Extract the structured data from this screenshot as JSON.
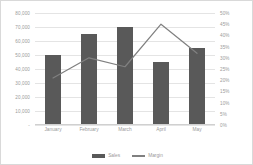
{
  "chart_data": {
    "type": "bar",
    "title": "",
    "xlabel": "",
    "ylabel": "",
    "categories": [
      "January",
      "February",
      "March",
      "April",
      "May"
    ],
    "series": [
      {
        "name": "Sales",
        "type": "bar",
        "axis": "left",
        "color": "#595959",
        "values": [
          50000,
          65000,
          70000,
          45000,
          55000
        ]
      },
      {
        "name": "Margin",
        "type": "line",
        "axis": "right",
        "color": "#808080",
        "values": [
          0.21,
          0.3,
          0.26,
          0.45,
          0.32
        ]
      }
    ],
    "left_axis": {
      "min": 0,
      "max": 80000,
      "step": 10000,
      "tick_labels": [
        "80,000",
        "70,000",
        "60,000",
        "50,000",
        "40,000",
        "30,000",
        "20,000",
        "10,000",
        "-"
      ]
    },
    "right_axis": {
      "min": 0,
      "max": 0.5,
      "step": 0.05,
      "tick_labels": [
        "50%",
        "45%",
        "40%",
        "35%",
        "30%",
        "25%",
        "20%",
        "15%",
        "10%",
        "5%",
        "0%"
      ]
    },
    "grid": true,
    "legend_position": "bottom"
  },
  "legend": {
    "sales_label": "Sales",
    "margin_label": "Margin"
  },
  "colors": {
    "bar": "#595959",
    "line": "#808080",
    "grid": "#e4e4e4",
    "tick_text": "#9a9a9a",
    "frame": "#d9d9d9"
  }
}
